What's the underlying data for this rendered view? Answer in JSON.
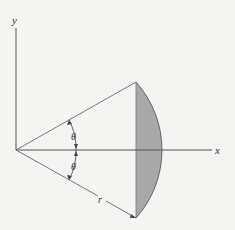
{
  "diagram": {
    "type": "circular-segment",
    "axes": {
      "x_label": "x",
      "y_label": "y"
    },
    "labels": {
      "upper_angle": "θ",
      "lower_angle": "θ",
      "radius": "r"
    },
    "colors": {
      "line": "#555555",
      "fill": "#a8a8a8",
      "background": "#f4f4f2"
    }
  }
}
